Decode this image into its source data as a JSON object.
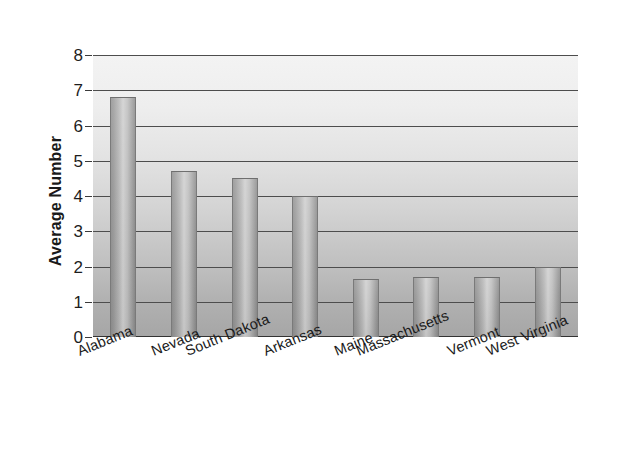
{
  "chart_data": {
    "type": "bar",
    "title": "",
    "subtitle": "",
    "xlabel": "",
    "ylabel": "Average Number",
    "ylim": [
      0,
      8
    ],
    "ytick_labels": [
      "8",
      "7",
      "6",
      "5",
      "4",
      "3",
      "2",
      "1",
      "0"
    ],
    "ytick_values": [
      8,
      7,
      6,
      5,
      4,
      3,
      2,
      1,
      0
    ],
    "grid": true,
    "legend": false,
    "legend_position": "none",
    "categories": [
      "Alabama",
      "Nevada",
      "South Dakota",
      "Arkansas",
      "Maine",
      "Massachusetts",
      "Vermont",
      "West Virginia"
    ],
    "values": [
      6.8,
      4.7,
      4.5,
      4.0,
      1.65,
      1.7,
      1.7,
      2.0
    ],
    "bar_color": "#b5b5b5",
    "plot_background_top": "#f3f3f3",
    "plot_background_bottom": "#a6a6a6",
    "gridline_color": "#4d4d4d",
    "text_color": "#1a1a1a"
  }
}
